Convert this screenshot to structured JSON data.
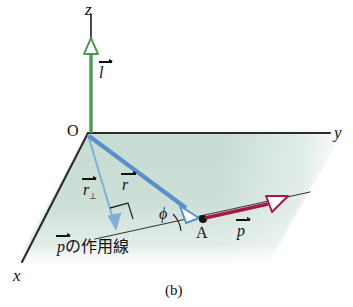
{
  "figure": {
    "caption": "(b)",
    "type": "3d-vector-diagram"
  },
  "axes": {
    "x_label": "x",
    "y_label": "y",
    "z_label": "z"
  },
  "points": {
    "origin_label": "O",
    "point_a_label": "A"
  },
  "vectors": {
    "l": {
      "label": "l",
      "color": "#4e9a52",
      "description": "angular momentum along z"
    },
    "r": {
      "label": "r",
      "color": "#5b8fc9",
      "description": "position vector from O to A"
    },
    "r_perp": {
      "label": "r",
      "subscript": "⊥",
      "color": "#7fb0d8",
      "description": "perpendicular distance from O to line of action"
    },
    "p": {
      "label": "p",
      "color": "#a81840",
      "description": "momentum vector at A"
    }
  },
  "angles": {
    "phi": "ϕ"
  },
  "annotations": {
    "line_of_action": "の作用線",
    "line_of_action_vector": "p",
    "right_angle_marker": "⊥"
  },
  "colors": {
    "plane_fill": "#cde0d8",
    "axis_line": "#2b2b2b",
    "green": "#4e9a52",
    "blue": "#5b8fc9",
    "blue_light": "#7fb0d8",
    "red": "#a81840",
    "background": "#ffffff"
  }
}
